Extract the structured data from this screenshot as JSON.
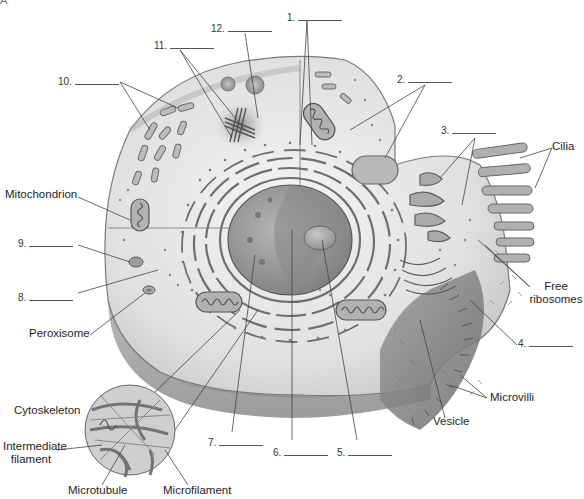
{
  "figure": {
    "corner_letter": "A",
    "colors": {
      "background": "#ffffff",
      "cytoplasm": "#d9d9d9",
      "cytoplasm_light": "#ececec",
      "membrane": "#8a8a8a",
      "organelle": "#a8a8a8",
      "organelle_dark": "#6f6f6f",
      "nucleus": "#9a9a9a",
      "leader_line": "#444444"
    }
  },
  "blank_labels": [
    {
      "id": "1",
      "text": "1."
    },
    {
      "id": "2",
      "text": "2."
    },
    {
      "id": "3",
      "text": "3."
    },
    {
      "id": "4",
      "text": "4."
    },
    {
      "id": "5",
      "text": "5."
    },
    {
      "id": "6",
      "text": "6."
    },
    {
      "id": "7",
      "text": "7."
    },
    {
      "id": "8",
      "text": "8."
    },
    {
      "id": "9",
      "text": "9."
    },
    {
      "id": "10",
      "text": "10."
    },
    {
      "id": "11",
      "text": "11."
    },
    {
      "id": "12",
      "text": "12."
    }
  ],
  "named_labels": {
    "cilia": "Cilia",
    "mitochondrion": "Mitochondrion",
    "free_ribosomes_line1": "Free",
    "free_ribosomes_line2": "ribosomes",
    "peroxisome": "Peroxisome",
    "microvilli": "Microvilli",
    "vesicle": "Vesicle",
    "cytoskeleton": "Cytoskeleton",
    "intermediate_filament_line1": "Intermediate",
    "intermediate_filament_line2": "filament",
    "microtubule": "Microtubule",
    "microfilament": "Microfilament"
  }
}
